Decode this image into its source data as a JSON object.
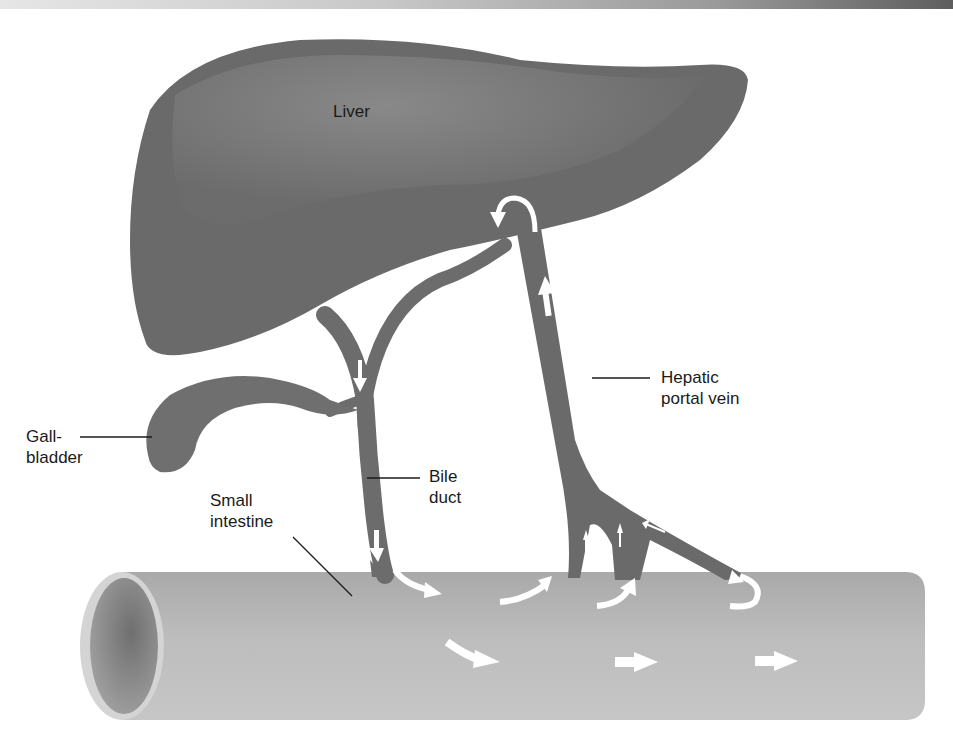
{
  "figure": {
    "colors": {
      "liver": "#6e6e6e",
      "liver_highlight": "#8a8a8a",
      "vessel": "#6a6a6a",
      "intestine": "#b8b8b8",
      "intestine_lumen": "#8c8c8c",
      "arrow": "#ffffff",
      "leader_line": "#1a1a1a"
    }
  },
  "labels": {
    "liver": "Liver",
    "gallbladder": [
      "Gall-",
      "bladder"
    ],
    "small_intestine": [
      "Small",
      "intestine"
    ],
    "bile_duct": [
      "Bile",
      "duct"
    ],
    "hepatic_portal_vein": [
      "Hepatic",
      "portal vein"
    ]
  },
  "arrows": {
    "bile_flow": [
      "down bile duct from liver",
      "into small intestine"
    ],
    "portal_flow": [
      "up from intestine branches",
      "up portal vein",
      "into liver (curved)"
    ],
    "intestinal_flow": [
      "right",
      "right",
      "right"
    ]
  }
}
